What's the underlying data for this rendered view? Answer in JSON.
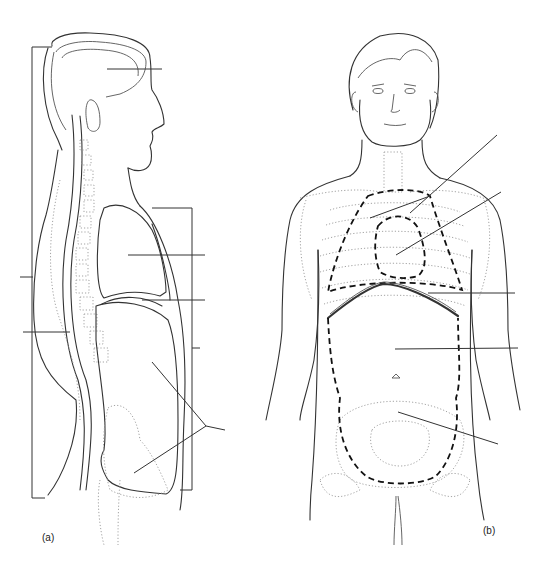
{
  "figure": {
    "panels": [
      {
        "id": "a",
        "label": "(a)",
        "view": "lateral"
      },
      {
        "id": "b",
        "label": "(b)",
        "view": "anterior"
      }
    ],
    "colors": {
      "line": "#333333",
      "dotted": "#999999",
      "background": "#ffffff"
    }
  }
}
